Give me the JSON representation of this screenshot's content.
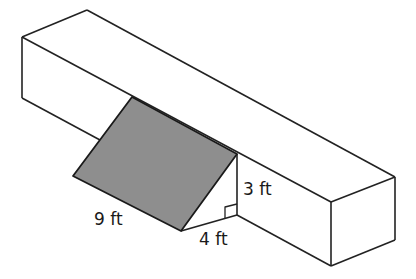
{
  "diagram": {
    "type": "geometry-prism-ramp",
    "colors": {
      "shaded_face": "#8e8e8e",
      "lines": "#222222",
      "background": "#ffffff"
    },
    "labels": {
      "slant_length": "9 ft",
      "base_length": "4 ft",
      "height": "3 ft"
    },
    "right_angle_marker": true
  }
}
